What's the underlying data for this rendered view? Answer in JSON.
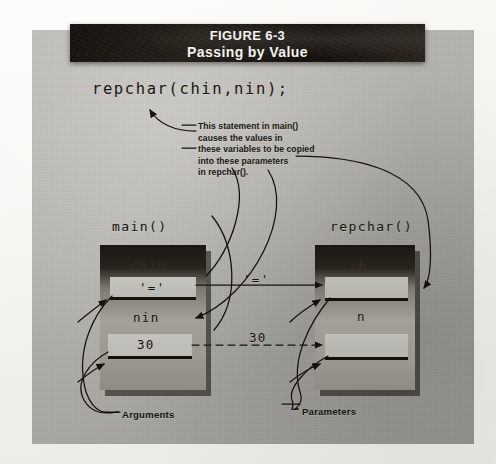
{
  "figure": {
    "number": "FIGURE 6-3",
    "title": "Passing by Value"
  },
  "code": {
    "statement": "repchar(chin,nin);"
  },
  "annotation": {
    "lines": [
      "This statement in main()",
      "causes the values in",
      "these variables to be copied",
      "into these parameters",
      "in repchar()."
    ]
  },
  "frames": [
    {
      "caption": "main()",
      "variables": [
        {
          "name": "chin",
          "value": "'='"
        },
        {
          "name": "nin",
          "value": "30"
        }
      ],
      "bottom_label": "Arguments"
    },
    {
      "caption": "repchar()",
      "variables": [
        {
          "name": "ch",
          "value": ""
        },
        {
          "name": "n",
          "value": ""
        }
      ],
      "bottom_label": "Parameters"
    }
  ],
  "transferred_values": {
    "char_value": "'='",
    "int_value": "30"
  },
  "colors": {
    "panel_gray": "#b3b1ac",
    "header_dark": "#1a1713",
    "ink": "#16140e",
    "cell_fill": "#c5c3be",
    "page_white": "#f5f3ef"
  }
}
